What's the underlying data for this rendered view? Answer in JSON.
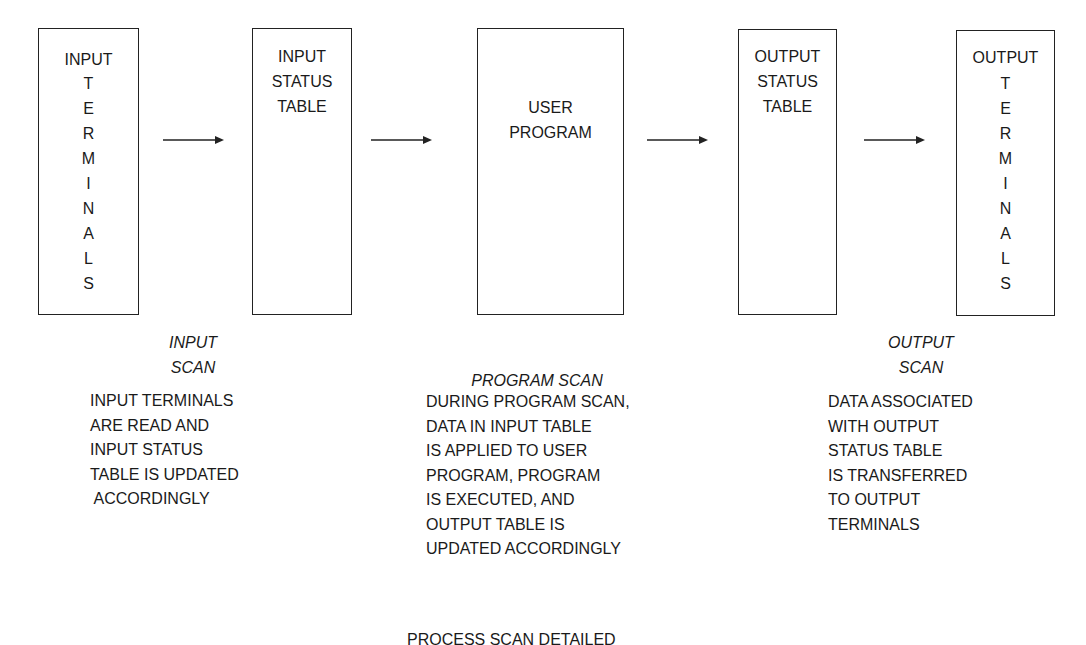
{
  "diagram": {
    "boxes": [
      {
        "id": "input-terminals",
        "top": "INPUT",
        "vertical": [
          "T",
          "E",
          "R",
          "M",
          "I",
          "N",
          "A",
          "L",
          "S"
        ]
      },
      {
        "id": "input-status-table",
        "lines": [
          "INPUT",
          "STATUS",
          "TABLE"
        ]
      },
      {
        "id": "user-program",
        "lines": [
          "USER",
          "PROGRAM"
        ]
      },
      {
        "id": "output-status-table",
        "lines": [
          "OUTPUT",
          "STATUS",
          "TABLE"
        ]
      },
      {
        "id": "output-terminals",
        "top": "OUTPUT",
        "vertical": [
          "T",
          "E",
          "R",
          "M",
          "I",
          "N",
          "A",
          "L",
          "S"
        ]
      }
    ],
    "arrows": [
      {
        "from": "input-terminals",
        "to": "input-status-table"
      },
      {
        "from": "input-status-table",
        "to": "user-program"
      },
      {
        "from": "user-program",
        "to": "output-status-table"
      },
      {
        "from": "output-status-table",
        "to": "output-terminals"
      }
    ],
    "scans": {
      "input": {
        "title": [
          "INPUT",
          "SCAN"
        ],
        "description": [
          "INPUT TERMINALS",
          "ARE READ AND",
          "INPUT STATUS",
          "TABLE IS UPDATED",
          " ACCORDINGLY"
        ]
      },
      "program": {
        "title": [
          "PROGRAM SCAN"
        ],
        "description": [
          "DURING PROGRAM SCAN,",
          "DATA IN INPUT TABLE",
          "IS APPLIED TO USER",
          "PROGRAM, PROGRAM",
          "IS EXECUTED, AND",
          "OUTPUT TABLE IS",
          "UPDATED ACCORDINGLY"
        ]
      },
      "output": {
        "title": [
          "OUTPUT",
          "SCAN"
        ],
        "description": [
          "DATA ASSOCIATED",
          "WITH OUTPUT",
          "STATUS TABLE",
          "IS TRANSFERRED",
          "TO OUTPUT",
          "TERMINALS"
        ]
      }
    },
    "caption": "PROCESS SCAN DETAILED",
    "colors": {
      "line": "#222222",
      "text": "#1a1a1a",
      "background": "#ffffff"
    }
  }
}
